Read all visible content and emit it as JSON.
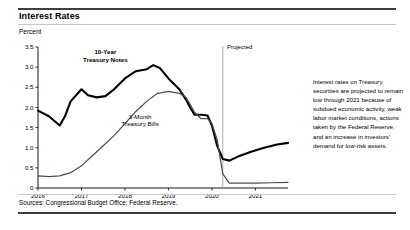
{
  "figure": {
    "title": "Interest Rates",
    "unit_label": "Percent",
    "projection_label": "Projected",
    "side_note": "Interest rates on Treasury securities are projected to remain low through 2021 because of subdued economic activity, weak labor market conditions, actions taken by the Federal Reserve, and an increase in investors' demand for low-risk assets.",
    "source_note": "Sources: Congressional Budget Office; Federal Reserve.",
    "colors": {
      "notes_series": "#000000",
      "bills_series": "#4d4d4d",
      "axis": "#000000",
      "rule_dark": "#3f3f3f",
      "rule_light": "#c9c9c9"
    }
  },
  "chart_data": {
    "type": "line",
    "title": "Interest Rates",
    "xlabel": "",
    "ylabel": "Percent",
    "ylim": [
      0,
      3.5
    ],
    "xlim": [
      2016,
      2021.75
    ],
    "grid": false,
    "legend": "inline-labels",
    "ytick_labels": [
      "0",
      "0.5",
      "1.0",
      "1.5",
      "2.0",
      "2.5",
      "3.0",
      "3.5"
    ],
    "ytick_values": [
      0,
      0.5,
      1.0,
      1.5,
      2.0,
      2.5,
      3.0,
      3.5
    ],
    "xtick_labels": [
      "2016",
      "2017",
      "2018",
      "2019",
      "2020",
      "2021"
    ],
    "xtick_values": [
      2016,
      2017,
      2018,
      2019,
      2020,
      2021
    ],
    "projection_start": 2020.25,
    "annotations": [
      {
        "text": "Projected",
        "x": 2020.3,
        "y": 3.45
      },
      {
        "text": "10-Year Treasury Notes",
        "x": 2017.55,
        "y": 3.32
      },
      {
        "text": "3-Month Treasury Bills",
        "x": 2018.35,
        "y": 1.72
      }
    ],
    "series": [
      {
        "name": "10-Year Treasury Notes",
        "color": "#000000",
        "x": [
          2016.0,
          2016.25,
          2016.5,
          2016.62,
          2016.75,
          2017.0,
          2017.15,
          2017.35,
          2017.55,
          2017.75,
          2018.0,
          2018.25,
          2018.5,
          2018.65,
          2018.8,
          2019.0,
          2019.25,
          2019.4,
          2019.5,
          2019.6,
          2019.75,
          2019.9,
          2020.0,
          2020.12,
          2020.25,
          2020.4,
          2020.6,
          2020.9,
          2021.2,
          2021.5,
          2021.75
        ],
        "y": [
          1.92,
          1.78,
          1.55,
          1.78,
          2.15,
          2.45,
          2.3,
          2.25,
          2.28,
          2.45,
          2.72,
          2.9,
          2.95,
          3.05,
          2.98,
          2.72,
          2.45,
          2.2,
          2.0,
          1.82,
          1.82,
          1.8,
          1.55,
          1.05,
          0.72,
          0.68,
          0.78,
          0.9,
          1.0,
          1.08,
          1.12
        ]
      },
      {
        "name": "3-Month Treasury Bills",
        "color": "#4d4d4d",
        "x": [
          2016.0,
          2016.25,
          2016.5,
          2016.75,
          2017.0,
          2017.25,
          2017.5,
          2017.75,
          2018.0,
          2018.25,
          2018.5,
          2018.75,
          2019.0,
          2019.25,
          2019.4,
          2019.5,
          2019.6,
          2019.75,
          2019.9,
          2020.0,
          2020.12,
          2020.25,
          2020.4,
          2020.75,
          2021.0,
          2021.4,
          2021.75
        ],
        "y": [
          0.3,
          0.28,
          0.3,
          0.38,
          0.55,
          0.8,
          1.05,
          1.3,
          1.6,
          1.9,
          2.15,
          2.35,
          2.4,
          2.35,
          2.25,
          2.08,
          1.88,
          1.72,
          1.72,
          1.6,
          1.2,
          0.35,
          0.12,
          0.12,
          0.12,
          0.13,
          0.14
        ]
      }
    ]
  }
}
